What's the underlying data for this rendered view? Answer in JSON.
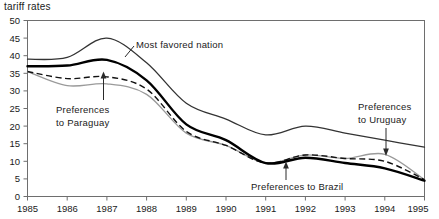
{
  "chart_title": "tariff rates",
  "chart_data": {
    "type": "line",
    "title": "tariff rates",
    "xlabel": "",
    "ylabel": "",
    "xlim": [
      1985,
      1995
    ],
    "ylim": [
      0,
      50
    ],
    "ytick_step": 5,
    "grid": false,
    "legend": "none (inline annotations)",
    "x": [
      1985,
      1986,
      1987,
      1988,
      1989,
      1990,
      1991,
      1992,
      1993,
      1994,
      1995
    ],
    "xticklabels": [
      "1985",
      "1986",
      "1987",
      "1988",
      "1989",
      "1990",
      "1991",
      "1992",
      "1993",
      "1994",
      "1995"
    ],
    "yticklabels": [
      "0",
      "5",
      "10",
      "15",
      "20",
      "25",
      "30",
      "35",
      "40",
      "45",
      "50"
    ],
    "series": [
      {
        "name": "Most favored nation",
        "style": "thin-solid-dark",
        "color": "#333333",
        "values": [
          39.0,
          39.5,
          45.0,
          38.0,
          26.5,
          22.0,
          17.5,
          20.0,
          18.0,
          16.0,
          14.0
        ]
      },
      {
        "name": "Preferences to Brazil",
        "style": "thick-solid-black",
        "color": "#000000",
        "values": [
          37.0,
          37.2,
          38.8,
          33.0,
          20.5,
          16.0,
          9.5,
          11.0,
          9.5,
          8.0,
          4.5
        ]
      },
      {
        "name": "Preferences to Paraguay",
        "style": "dashed-black",
        "color": "#111111",
        "values": [
          35.5,
          33.5,
          34.0,
          30.5,
          18.5,
          14.5,
          9.5,
          11.8,
          10.8,
          10.0,
          4.8
        ]
      },
      {
        "name": "Preferences to Uruguay",
        "style": "thin-solid-gray",
        "color": "#9a9a9a",
        "values": [
          35.5,
          31.5,
          32.0,
          29.0,
          18.0,
          14.5,
          9.5,
          11.8,
          10.8,
          12.0,
          4.8
        ]
      }
    ],
    "annotations": [
      {
        "text_line1": "Most favored nation",
        "text_line2": "",
        "target": "Most favored nation"
      },
      {
        "text_line1": "Preferences",
        "text_line2": "to Paraguay",
        "target": "Preferences to Paraguay"
      },
      {
        "text_line1": "Preferences to Brazil",
        "text_line2": "",
        "target": "Preferences to Brazil"
      },
      {
        "text_line1": "Preferences",
        "text_line2": "to Uruguay",
        "target": "Preferences to Uruguay"
      }
    ]
  },
  "annotations": {
    "mfn": "Most favored nation",
    "paraguay_l1": "Preferences",
    "paraguay_l2": "to Paraguay",
    "brazil": "Preferences to Brazil",
    "uruguay_l1": "Preferences",
    "uruguay_l2": "to Uruguay"
  }
}
